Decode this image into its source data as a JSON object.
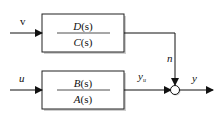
{
  "diagram": {
    "noise_block": {
      "numerator": "D(s)",
      "num_fn": "D",
      "den_fn": "C",
      "arg": "(s)",
      "denominator": "C(s)"
    },
    "plant_block": {
      "numerator": "B(s)",
      "num_fn": "B",
      "den_fn": "A",
      "arg": "(s)",
      "denominator": "A(s)"
    },
    "signals": {
      "noise_input": "v",
      "control_input": "u",
      "noise_output": "n",
      "plant_output": "y",
      "plant_output_sub": "u",
      "total_output": "y"
    }
  }
}
